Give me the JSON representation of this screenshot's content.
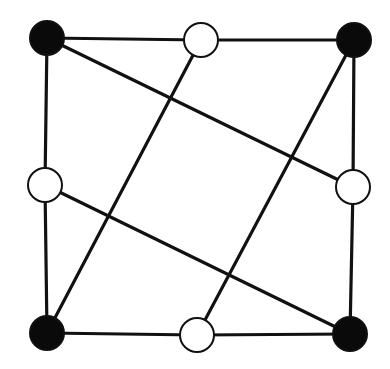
{
  "diagram": {
    "type": "graph",
    "canvas": {
      "width": 390,
      "height": 369,
      "background": "#ffffff"
    },
    "style": {
      "edge_color": "#111111",
      "edge_width": 3.2,
      "node_radius": 17,
      "node_stroke": "#111111",
      "node_stroke_width": 2,
      "black_fill": "#0a0a0a",
      "white_fill": "#ffffff"
    },
    "nodes": [
      {
        "id": "TL",
        "x": 47,
        "y": 38,
        "fill": "black"
      },
      {
        "id": "TM",
        "x": 201,
        "y": 40,
        "fill": "white"
      },
      {
        "id": "TR",
        "x": 354,
        "y": 40,
        "fill": "black"
      },
      {
        "id": "LM",
        "x": 45,
        "y": 185,
        "fill": "white"
      },
      {
        "id": "RM",
        "x": 353,
        "y": 187,
        "fill": "white"
      },
      {
        "id": "BL",
        "x": 47,
        "y": 333,
        "fill": "black"
      },
      {
        "id": "BM",
        "x": 197,
        "y": 335,
        "fill": "white"
      },
      {
        "id": "BR",
        "x": 350,
        "y": 334,
        "fill": "black"
      }
    ],
    "edges": [
      [
        "TL",
        "TM"
      ],
      [
        "TM",
        "TR"
      ],
      [
        "TL",
        "LM"
      ],
      [
        "LM",
        "BL"
      ],
      [
        "BL",
        "BM"
      ],
      [
        "BM",
        "BR"
      ],
      [
        "TR",
        "RM"
      ],
      [
        "RM",
        "BR"
      ],
      [
        "TL",
        "RM"
      ],
      [
        "LM",
        "BR"
      ],
      [
        "TM",
        "BL"
      ],
      [
        "TR",
        "BM"
      ]
    ]
  }
}
